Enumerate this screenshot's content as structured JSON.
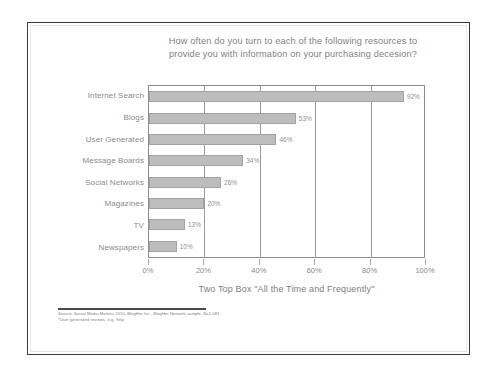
{
  "chart_data": {
    "type": "bar",
    "orientation": "horizontal",
    "title": "How often do you turn to each of the following resources to provide you with information on your purchasing decesion?",
    "title_lines": [
      "How often do you turn to each of the following resources to",
      "provide you with information on your purchasing decesion?"
    ],
    "categories": [
      "Internet Search",
      "Blogs",
      "User Generated",
      "Message Boards",
      "Social Networks",
      "Magazines",
      "TV",
      "Newspapers"
    ],
    "values": [
      92,
      53,
      46,
      34,
      26,
      20,
      13,
      10
    ],
    "value_labels": [
      "92%",
      "53%",
      "46%",
      "34%",
      "26%",
      "20%",
      "13%",
      "10%"
    ],
    "xlabel": "Two Top Box \"All the Time and Frequently\"",
    "ylabel": "",
    "xlim": [
      0,
      100
    ],
    "xticks": [
      0,
      20,
      40,
      60,
      80,
      100
    ],
    "xtick_labels": [
      "0%",
      "20%",
      "40%",
      "60%",
      "80%",
      "100%"
    ],
    "grid": true,
    "grid_axis": "x",
    "legend": false,
    "bar_color": "#bdbdbd",
    "bar_border_color": "#a2a2a2",
    "text_color": "#8a8a8a",
    "plot_border_color": "#8c8c8c"
  },
  "footnote": {
    "lines": [
      "Source: Social Media Matters 2010, BlogHer Inc., BlogHer Network sample, N=1,081",
      "*User generated reviews, e.g. Yelp"
    ]
  }
}
